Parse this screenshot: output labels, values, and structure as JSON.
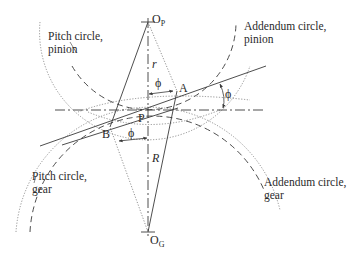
{
  "diagram": {
    "labels": {
      "pitch_pinion": "Pitch circle,\npinion",
      "addendum_pinion": "Addendum circle,\npinion",
      "pitch_gear": "Pitch circle,\ngear",
      "addendum_gear": "Addendum circle,\ngear"
    },
    "points": {
      "op_main": "O",
      "op_sub": "P",
      "og_main": "O",
      "og_sub": "G",
      "pitch_point": "P",
      "point_a": "A",
      "point_b": "B"
    },
    "symbols": {
      "radius_pinion": "r",
      "radius_gear": "R",
      "phi_top": "ϕ",
      "phi_right": "ϕ",
      "phi_bottom": "ϕ"
    },
    "colors": {
      "line": "#3a3a3a",
      "dotted": "#777777",
      "text": "#2a2a2a"
    }
  }
}
